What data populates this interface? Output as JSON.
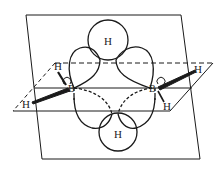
{
  "diagram": {
    "colors": {
      "line": "#1a1a1a",
      "background": "#ffffff"
    },
    "atoms": {
      "bridge_top": {
        "label": "H"
      },
      "bridge_bottom": {
        "label": "H"
      },
      "boron_left": {
        "label": "B"
      },
      "boron_right": {
        "label": "B"
      },
      "terminal_left_upper": {
        "label": "H"
      },
      "terminal_left_lower": {
        "label": "H"
      },
      "terminal_right_upper": {
        "label": "H"
      },
      "terminal_right_lower": {
        "label": "H"
      }
    },
    "planes": [
      {
        "name": "vertical-plane"
      },
      {
        "name": "horizontal-plane"
      }
    ]
  }
}
